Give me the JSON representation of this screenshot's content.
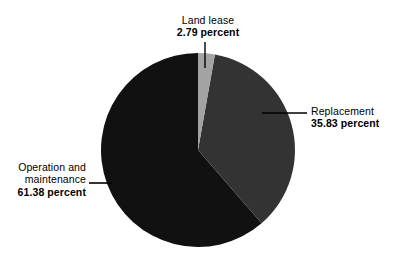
{
  "chart_data": {
    "type": "pie",
    "title": "",
    "subtitle": "",
    "xlabel": "",
    "ylabel": "",
    "unit": "percent",
    "legend_position": "none",
    "grid": false,
    "categories": [
      "Land lease",
      "Replacement",
      "Operation and maintenance"
    ],
    "values": [
      2.79,
      35.83,
      61.38
    ],
    "labels": [
      "2.79 percent",
      "35.83 percent",
      "61.38 percent"
    ],
    "start_angle_deg": 0,
    "direction": "clockwise",
    "slices": [
      {
        "name": "Land lease",
        "value": 2.79,
        "value_label": "2.79 percent",
        "color": "#a3a3a3",
        "start_deg": 0.0,
        "end_deg": 10.04,
        "label_position": "top"
      },
      {
        "name": "Replacement",
        "value": 35.83,
        "value_label": "35.83 percent",
        "color": "#333333",
        "start_deg": 10.04,
        "end_deg": 139.03,
        "label_position": "right"
      },
      {
        "name": "Operation and maintenance",
        "value": 61.38,
        "value_label": "61.38 percent",
        "color": "#111111",
        "start_deg": 139.03,
        "end_deg": 360.0,
        "label_position": "left"
      }
    ]
  },
  "labels": {
    "land_lease": {
      "name": "Land lease",
      "value": "2.79 percent"
    },
    "replacement": {
      "name": "Replacement",
      "value": "35.83 percent"
    },
    "operation": {
      "name_line_1": "Operation and",
      "name_line_2": "maintenance",
      "value": "61.38 percent"
    }
  },
  "colors": {
    "background": "#ffffff",
    "text": "#000000",
    "leader_line": "#000000",
    "slice_land_lease": "#a3a3a3",
    "slice_replacement": "#333333",
    "slice_operation": "#111111"
  }
}
